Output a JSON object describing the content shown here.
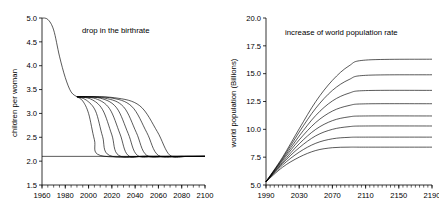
{
  "figure": {
    "background": "#ffffff",
    "line_color": "#000000",
    "panel_count": 2
  },
  "chart_data": [
    {
      "id": "birthrate",
      "type": "line",
      "title": "drop in the birthrate",
      "xlabel": "",
      "ylabel": "children per woman",
      "xlim": [
        1960,
        2100
      ],
      "ylim": [
        1.5,
        5.0
      ],
      "xticks": [
        1960,
        1980,
        2000,
        2020,
        2040,
        2060,
        2080,
        2100
      ],
      "xtick_labels": [
        "1960",
        "1980",
        "2000",
        "2020",
        "2040",
        "2060",
        "2080",
        "2100"
      ],
      "yticks": [
        1.5,
        2.0,
        2.5,
        3.0,
        3.5,
        4.0,
        4.5,
        5.0
      ],
      "ytick_labels": [
        "1.5",
        "2.0",
        "2.5",
        "3.0",
        "3.5",
        "4.0",
        "4.5",
        "5.0"
      ],
      "minor_tick_interval_x": 5,
      "grid": false,
      "legend": "none",
      "annotations": [
        {
          "text": "drop in the birthrate",
          "x": 1993,
          "y": 4.62
        }
      ],
      "reference_lines": [
        {
          "name": "replacement-fertility",
          "value": 2.1,
          "orientation": "horizontal"
        }
      ],
      "historical": {
        "name": "observed-birthrate",
        "x": [
          1960,
          1965,
          1970,
          1975,
          1980,
          1985,
          1990
        ],
        "values": [
          5.0,
          4.97,
          4.75,
          4.2,
          3.75,
          3.45,
          3.35
        ]
      },
      "series": [
        {
          "name": "scenario-1-stabilize-2010",
          "stabilize_year": 2010,
          "x": [
            1990,
            1995,
            2000,
            2005,
            2010,
            2050,
            2100
          ],
          "values": [
            3.35,
            3.26,
            3.0,
            2.45,
            2.12,
            2.1,
            2.1
          ]
        },
        {
          "name": "scenario-2-stabilize-2018",
          "stabilize_year": 2018,
          "x": [
            1990,
            1998,
            2006,
            2012,
            2018,
            2050,
            2100
          ],
          "values": [
            3.35,
            3.28,
            3.05,
            2.52,
            2.12,
            2.1,
            2.1
          ]
        },
        {
          "name": "scenario-3-stabilize-2026",
          "stabilize_year": 2026,
          "x": [
            1990,
            2002,
            2012,
            2020,
            2026,
            2050,
            2100
          ],
          "values": [
            3.35,
            3.3,
            3.08,
            2.55,
            2.12,
            2.1,
            2.1
          ]
        },
        {
          "name": "scenario-4-stabilize-2034",
          "stabilize_year": 2034,
          "x": [
            1990,
            2006,
            2018,
            2027,
            2034,
            2050,
            2100
          ],
          "values": [
            3.35,
            3.31,
            3.1,
            2.57,
            2.12,
            2.1,
            2.1
          ]
        },
        {
          "name": "scenario-5-stabilize-2042",
          "stabilize_year": 2042,
          "x": [
            1990,
            2010,
            2024,
            2034,
            2042,
            2060,
            2100
          ],
          "values": [
            3.35,
            3.32,
            3.12,
            2.58,
            2.12,
            2.1,
            2.1
          ]
        },
        {
          "name": "scenario-6-stabilize-2050",
          "stabilize_year": 2050,
          "x": [
            1990,
            2014,
            2030,
            2041,
            2050,
            2070,
            2100
          ],
          "values": [
            3.35,
            3.32,
            3.14,
            2.6,
            2.12,
            2.1,
            2.1
          ]
        },
        {
          "name": "scenario-7-stabilize-2060",
          "stabilize_year": 2060,
          "x": [
            1990,
            2018,
            2037,
            2050,
            2060,
            2080,
            2100
          ],
          "values": [
            3.35,
            3.33,
            3.15,
            2.6,
            2.12,
            2.1,
            2.1
          ]
        },
        {
          "name": "scenario-8-stabilize-2070",
          "stabilize_year": 2070,
          "x": [
            1990,
            2022,
            2044,
            2059,
            2070,
            2085,
            2100
          ],
          "values": [
            3.35,
            3.33,
            3.16,
            2.62,
            2.12,
            2.1,
            2.1
          ]
        }
      ]
    },
    {
      "id": "population",
      "type": "line",
      "title": "increase of world population rate",
      "xlabel": "",
      "ylabel": "world population (Billions)",
      "xlim": [
        1990,
        2190
      ],
      "ylim": [
        5.0,
        20.0
      ],
      "xticks": [
        1990,
        2030,
        2070,
        2110,
        2150,
        2190
      ],
      "xtick_labels": [
        "1990",
        "2030",
        "2070",
        "2110",
        "2150",
        "2190"
      ],
      "yticks": [
        5.0,
        7.5,
        10.0,
        12.5,
        15.0,
        17.5,
        20.0
      ],
      "ytick_labels": [
        "5.0",
        "7.5",
        "10.0",
        "12.5",
        "15.0",
        "17.5",
        "20.0"
      ],
      "minor_tick_interval_x": 5,
      "grid": false,
      "legend": "none",
      "annotations": [
        {
          "text": "increase of world population rate",
          "x": 2052,
          "y": 18.2
        }
      ],
      "start_population": 5.3,
      "series": [
        {
          "name": "projection-1",
          "plateau": 8.4,
          "x": [
            1990,
            2010,
            2030,
            2050,
            2070,
            2090,
            2110,
            2190
          ],
          "values": [
            5.3,
            6.6,
            7.5,
            8.1,
            8.35,
            8.4,
            8.4,
            8.4
          ]
        },
        {
          "name": "projection-2",
          "plateau": 9.3,
          "x": [
            1990,
            2010,
            2030,
            2050,
            2070,
            2090,
            2110,
            2190
          ],
          "values": [
            5.3,
            6.8,
            7.95,
            8.75,
            9.15,
            9.28,
            9.3,
            9.3
          ]
        },
        {
          "name": "projection-3",
          "plateau": 10.3,
          "x": [
            1990,
            2010,
            2030,
            2050,
            2070,
            2090,
            2110,
            2190
          ],
          "values": [
            5.3,
            6.95,
            8.35,
            9.42,
            10.0,
            10.24,
            10.3,
            10.3
          ]
        },
        {
          "name": "projection-4",
          "plateau": 11.2,
          "x": [
            1990,
            2010,
            2030,
            2050,
            2070,
            2090,
            2110,
            2190
          ],
          "values": [
            5.3,
            7.05,
            8.7,
            10.0,
            10.78,
            11.12,
            11.2,
            11.2
          ]
        },
        {
          "name": "projection-5",
          "plateau": 12.3,
          "x": [
            1990,
            2010,
            2030,
            2050,
            2070,
            2090,
            2110,
            2190
          ],
          "values": [
            5.3,
            7.2,
            9.05,
            10.62,
            11.64,
            12.14,
            12.29,
            12.3
          ]
        },
        {
          "name": "projection-6",
          "plateau": 13.5,
          "x": [
            1990,
            2010,
            2030,
            2050,
            2070,
            2090,
            2110,
            2190
          ],
          "values": [
            5.3,
            7.3,
            9.4,
            11.25,
            12.55,
            13.25,
            13.48,
            13.5
          ]
        },
        {
          "name": "projection-7",
          "plateau": 14.9,
          "x": [
            1990,
            2010,
            2030,
            2050,
            2070,
            2090,
            2110,
            2190
          ],
          "values": [
            5.3,
            7.4,
            9.75,
            11.9,
            13.5,
            14.47,
            14.85,
            14.9
          ]
        },
        {
          "name": "projection-8",
          "plateau": 16.3,
          "x": [
            1990,
            2010,
            2030,
            2050,
            2070,
            2090,
            2110,
            2190
          ],
          "values": [
            5.3,
            7.5,
            10.05,
            12.5,
            14.4,
            15.7,
            16.22,
            16.3
          ]
        }
      ]
    }
  ]
}
